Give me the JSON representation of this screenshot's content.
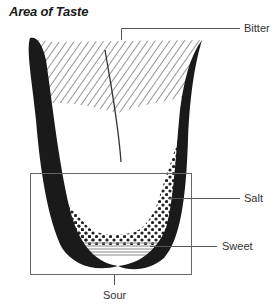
{
  "title": "Area of Taste",
  "labels": {
    "bitter": "Bitter",
    "salt": "Salt",
    "sweet": "Sweet",
    "sour": "Sour"
  },
  "regions": [
    {
      "name": "bitter",
      "pattern": "diagonal-hatch",
      "location": "back of tongue"
    },
    {
      "name": "salt",
      "pattern": "dots",
      "location": "sides and front"
    },
    {
      "name": "sweet",
      "pattern": "horizontal-lines",
      "location": "tip"
    },
    {
      "name": "sour",
      "pattern": "bracket-box",
      "location": "front half / sides"
    }
  ],
  "colors": {
    "outline": "#1a1a1a",
    "leader": "#555555",
    "hatch": "#666666",
    "dots": "#222222",
    "sweet_lines": "#888888"
  }
}
